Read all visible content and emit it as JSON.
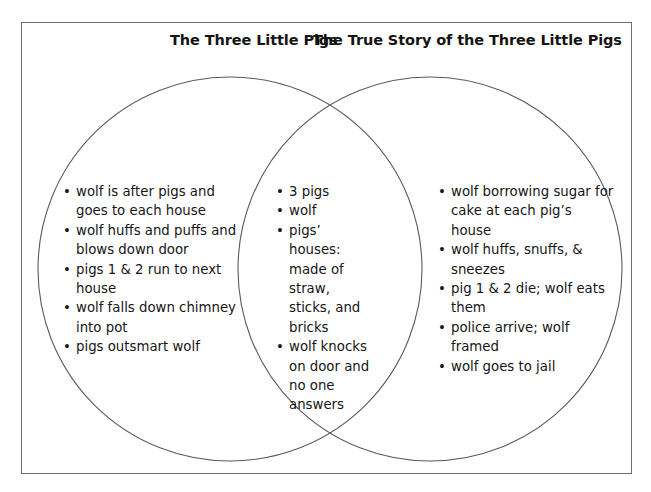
{
  "diagram": {
    "type": "venn",
    "frame": {
      "border_color": "#6e6e72"
    },
    "circle_color": "#5a5a60",
    "titles": {
      "left": "The Three Little Pigs",
      "right": "The True Story of the Three Little Pigs"
    },
    "bullet_glyph": "•",
    "left_only": [
      "wolf is after pigs and goes to each house",
      "wolf huffs and puffs and blows down door",
      "pigs 1 & 2 run to next house",
      "wolf falls down chimney into pot",
      "pigs outsmart wolf"
    ],
    "intersection": [
      "3 pigs",
      "wolf",
      "pigs’ houses: made of straw, sticks, and bricks",
      "wolf knocks on door and no one answers"
    ],
    "right_only": [
      "wolf borrowing sugar for cake at each pig’s house",
      "wolf huffs, snuffs, & sneezes",
      "pig 1 & 2 die; wolf eats them",
      "police arrive; wolf framed",
      "wolf goes to jail"
    ]
  }
}
